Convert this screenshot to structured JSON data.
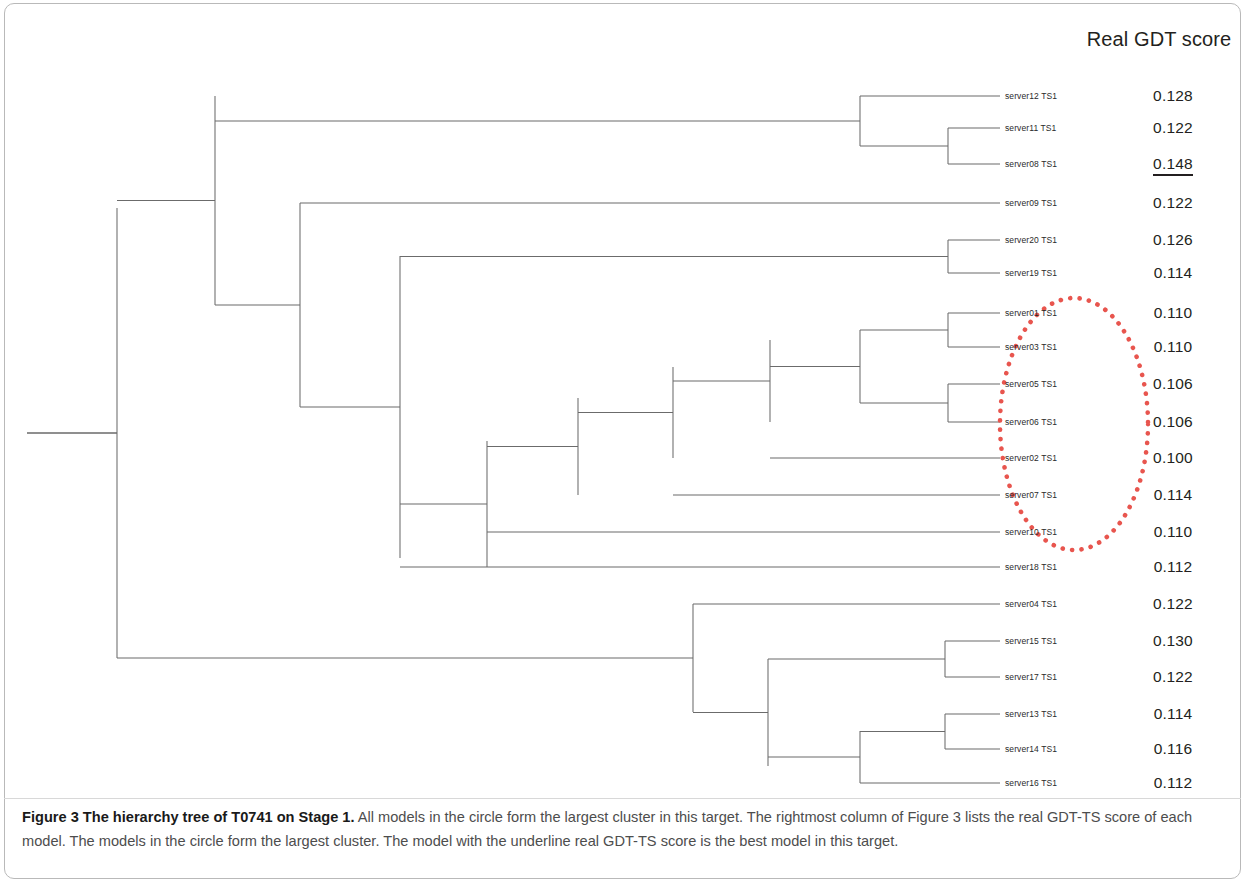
{
  "figure": {
    "column_header": "Real GDT score",
    "caption_bold": "Figure 3 The hierarchy tree of T0741 on Stage 1.",
    "caption_rest": " All models in the circle form the largest cluster in this target. The rightmost column of Figure 3 lists the real GDT-TS score of each model. The models in the circle form the largest cluster. The model with the underline real GDT-TS score is the best model in this target."
  },
  "colors": {
    "tree_line": "#6b6b6b",
    "circle": "#e8554e",
    "text": "#231f20",
    "caption": "#4d4d4d",
    "frame": "#b9b9b9"
  },
  "highlight": {
    "best_model": "server08 TS1",
    "best_score": "0.148",
    "circled_models": [
      "server01 TS1",
      "server03 TS1",
      "server05 TS1",
      "server06 TS1",
      "server02 TS1",
      "server07 TS1",
      "server10 TS1"
    ]
  },
  "chart_data": {
    "type": "table",
    "title": "The hierarchy tree of T0741 on Stage 1",
    "xlabel": "",
    "ylabel": "",
    "columns": [
      "Model",
      "Real GDT score"
    ],
    "leaves": [
      {
        "label": "server12 TS1",
        "score": "0.128",
        "y": 96,
        "x": 1000,
        "circled": false,
        "underline": false
      },
      {
        "label": "server11 TS1",
        "score": "0.122",
        "y": 128,
        "x": 1000,
        "circled": false,
        "underline": false
      },
      {
        "label": "server08 TS1",
        "score": "0.148",
        "y": 164,
        "x": 1000,
        "circled": false,
        "underline": true
      },
      {
        "label": "server09 TS1",
        "score": "0.122",
        "y": 203,
        "x": 1000,
        "circled": false,
        "underline": false
      },
      {
        "label": "server20 TS1",
        "score": "0.126",
        "y": 240,
        "x": 1000,
        "circled": false,
        "underline": false
      },
      {
        "label": "server19 TS1",
        "score": "0.114",
        "y": 273,
        "x": 1000,
        "circled": false,
        "underline": false
      },
      {
        "label": "server01 TS1",
        "score": "0.110",
        "y": 313,
        "x": 1000,
        "circled": true,
        "underline": false
      },
      {
        "label": "server03 TS1",
        "score": "0.110",
        "y": 347,
        "x": 1000,
        "circled": true,
        "underline": false
      },
      {
        "label": "server05 TS1",
        "score": "0.106",
        "y": 384,
        "x": 1000,
        "circled": true,
        "underline": false
      },
      {
        "label": "server06 TS1",
        "score": "0.106",
        "y": 422,
        "x": 1000,
        "circled": true,
        "underline": false
      },
      {
        "label": "server02 TS1",
        "score": "0.100",
        "y": 458,
        "x": 1000,
        "circled": true,
        "underline": false
      },
      {
        "label": "server07 TS1",
        "score": "0.114",
        "y": 495,
        "x": 1000,
        "circled": true,
        "underline": false
      },
      {
        "label": "server10 TS1",
        "score": "0.110",
        "y": 532,
        "x": 1000,
        "circled": true,
        "underline": false
      },
      {
        "label": "server18 TS1",
        "score": "0.112",
        "y": 567,
        "x": 1000,
        "circled": false,
        "underline": false
      },
      {
        "label": "server04 TS1",
        "score": "0.122",
        "y": 604,
        "x": 1000,
        "circled": false,
        "underline": false
      },
      {
        "label": "server15 TS1",
        "score": "0.130",
        "y": 641,
        "x": 1000,
        "circled": false,
        "underline": false
      },
      {
        "label": "server17 TS1",
        "score": "0.122",
        "y": 677,
        "x": 1000,
        "circled": false,
        "underline": false
      },
      {
        "label": "server13 TS1",
        "score": "0.114",
        "y": 714,
        "x": 1000,
        "circled": false,
        "underline": false
      },
      {
        "label": "server14 TS1",
        "score": "0.116",
        "y": 749,
        "x": 1000,
        "circled": false,
        "underline": false
      },
      {
        "label": "server16 TS1",
        "score": "0.112",
        "y": 783,
        "x": 1000,
        "circled": false,
        "underline": false
      }
    ],
    "root_stub": {
      "x1": 27,
      "x2": 117,
      "y": 433
    },
    "nodes": [
      {
        "name": "n-root",
        "x": 117,
        "ytop": 208,
        "ybot": 658,
        "parent_x": 27
      },
      {
        "name": "n-upper",
        "x": 215,
        "ytop": 96,
        "ybot": 305,
        "parent_x": 117
      },
      {
        "name": "n-top3",
        "x": 860,
        "ytop": 96,
        "ybot": 146,
        "parent_x": 215
      },
      {
        "name": "n-s11-s08",
        "x": 948,
        "ytop": 128,
        "ybot": 164,
        "parent_x": 860
      },
      {
        "name": "n-mid-group",
        "x": 300,
        "ytop": 203,
        "ybot": 407,
        "parent_x": 215
      },
      {
        "name": "n-s20-s19",
        "x": 948,
        "ytop": 240,
        "ybot": 273,
        "parent_x": 400
      },
      {
        "name": "n-core-top",
        "x": 400,
        "ytop": 256,
        "ybot": 558,
        "parent_x": 300
      },
      {
        "name": "n-lad1",
        "x": 487,
        "ytop": 441,
        "ybot": 567,
        "parent_x": 400
      },
      {
        "name": "n-lad2",
        "x": 578,
        "ytop": 398,
        "ybot": 495,
        "parent_x": 487
      },
      {
        "name": "n-lad3",
        "x": 673,
        "ytop": 367,
        "ybot": 458,
        "parent_x": 578
      },
      {
        "name": "n-lad4",
        "x": 770,
        "ytop": 340,
        "ybot": 422,
        "parent_x": 673
      },
      {
        "name": "n-lad5",
        "x": 860,
        "ytop": 330,
        "ybot": 403,
        "parent_x": 770
      },
      {
        "name": "n-s01-s03",
        "x": 948,
        "ytop": 313,
        "ybot": 347,
        "parent_x": 860
      },
      {
        "name": "n-s05-s06",
        "x": 948,
        "ytop": 384,
        "ybot": 422,
        "parent_x": 860
      },
      {
        "name": "n-lower",
        "x": 693,
        "ytop": 604,
        "ybot": 712,
        "parent_x": 117
      },
      {
        "name": "n-low2",
        "x": 768,
        "ytop": 659,
        "ybot": 766,
        "parent_x": 693
      },
      {
        "name": "n-s15-s17",
        "x": 945,
        "ytop": 641,
        "ybot": 677,
        "parent_x": 768
      },
      {
        "name": "n-low3",
        "x": 860,
        "ytop": 731,
        "ybot": 783,
        "parent_x": 768
      },
      {
        "name": "n-s13-s14",
        "x": 945,
        "ytop": 714,
        "ybot": 749,
        "parent_x": 860
      }
    ],
    "circle": {
      "cx": 1074,
      "cy": 424,
      "rx": 74,
      "ry": 126
    }
  }
}
